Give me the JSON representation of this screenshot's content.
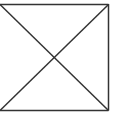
{
  "figure": {
    "shape": "square-with-diagonals",
    "icon": "image-placeholder-icon",
    "colors": {
      "background": "#ffffff",
      "stroke": "#333333"
    },
    "stroke_width": 1.5,
    "box": {
      "x1": 0,
      "y1": 4,
      "x2": 108,
      "y2": 110
    }
  }
}
